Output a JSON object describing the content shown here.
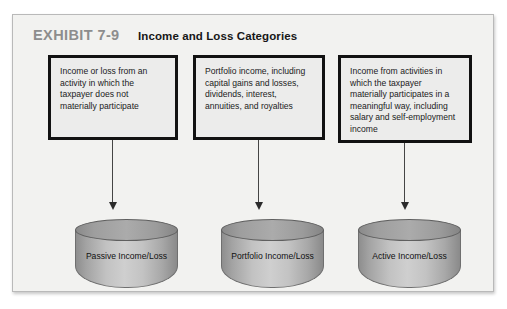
{
  "exhibit": {
    "number": "EXHIBIT 7-9",
    "title": "Income and Loss Categories"
  },
  "boxes": [
    {
      "id": "passive",
      "text": "Income or loss from an activity in which the taxpayer does not materially participate"
    },
    {
      "id": "portfolio",
      "text": "Portfolio income, including capital gains and losses, dividends, interest, annuities, and royalties"
    },
    {
      "id": "active",
      "text": "Income from activities in which the taxpayer materially participates in a meaningful way, including salary and self-employment income"
    }
  ],
  "cylinders": [
    {
      "id": "passive",
      "label": "Passive Income/Loss"
    },
    {
      "id": "portfolio",
      "label": "Portfolio Income/Loss"
    },
    {
      "id": "active",
      "label": "Active Income/Loss"
    }
  ],
  "colors": {
    "frame_background": "#f2f2f0",
    "frame_border": "#b9b9b9",
    "box_fill": "#ececeb",
    "box_border": "#121212",
    "exhibit_number": "#8d8d8d",
    "title_text": "#171717",
    "cylinder_mid": "#cfcfcf",
    "cylinder_edge": "#8a8a8a",
    "arrow": "#2b2b2b"
  }
}
